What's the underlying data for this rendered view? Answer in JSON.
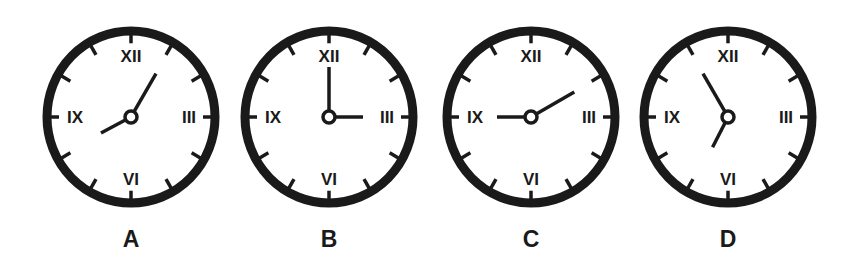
{
  "colors": {
    "ink": "#1a1a1a",
    "face": "#ffffff"
  },
  "numerals": {
    "twelve": "XII",
    "three": "III",
    "six": "VI",
    "nine": "IX"
  },
  "clocks": [
    {
      "label": "A",
      "cx": 131,
      "cy": 117,
      "rx": 84,
      "ry": 86,
      "time": "8:05",
      "hour_angle": 242,
      "minute_angle": 30
    },
    {
      "label": "B",
      "cx": 329,
      "cy": 117,
      "rx": 84,
      "ry": 86,
      "time": "3:00",
      "hour_angle": 90,
      "minute_angle": 0
    },
    {
      "label": "C",
      "cx": 531,
      "cy": 117,
      "rx": 84,
      "ry": 86,
      "time": "9:10",
      "hour_angle": 270,
      "minute_angle": 60
    },
    {
      "label": "D",
      "cx": 728,
      "cy": 117,
      "rx": 84,
      "ry": 86,
      "time": "6:55",
      "hour_angle": 207,
      "minute_angle": 330
    }
  ]
}
